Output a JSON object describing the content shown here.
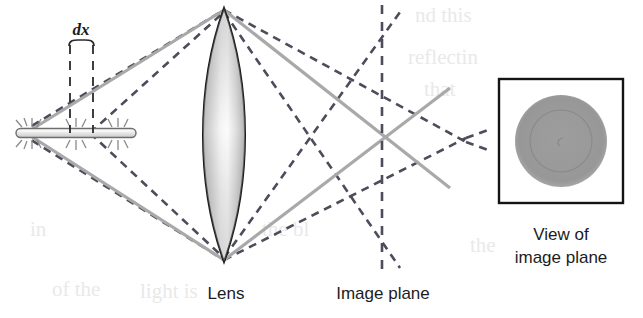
{
  "figure": {
    "width": 643,
    "height": 318,
    "background_color": "#ffffff"
  },
  "labels": {
    "dx": "dx",
    "lens": "Lens",
    "image_plane": "Image plane",
    "view_of_image_plane_line1": "View of",
    "view_of_image_plane_line2": "image plane"
  },
  "colors": {
    "ink": "#1c1c1c",
    "dashed_ray": "#4c4c5a",
    "solid_ray": "#a9a9a9",
    "lens_outline": "#1a1a1a",
    "lens_fill_light": "#fbfbfb",
    "lens_fill_dark": "#8e8e8e",
    "object_fill": "#d8d8d8",
    "object_outline": "#6e6e6e",
    "blur_disk": "#9a9a9a",
    "blur_disk_inner": "#8e8e8e",
    "panel_border": "#141414",
    "ghost_text": "#ededed"
  },
  "geometry": {
    "object": {
      "x_left": 16,
      "x_right": 136,
      "y": 133,
      "thickness": 9,
      "dx_mark_left": 70,
      "dx_mark_right": 93
    },
    "lens": {
      "center_x": 224,
      "top_y": 8,
      "bottom_y": 262,
      "half_width": 24
    },
    "image_plane": {
      "x": 382,
      "y_top": 5,
      "y_bottom": 270
    },
    "focus_point_solid": {
      "x": 382,
      "y": 136
    },
    "focus_point_dashed": {
      "x": 466,
      "y": 140
    },
    "view_panel": {
      "x": 499,
      "y": 79,
      "width": 124,
      "height": 124,
      "disk_cx": 561,
      "disk_cy": 141,
      "disk_r_outer": 46,
      "disk_r_inner": 31
    }
  },
  "rays": {
    "solid_label": "in-focus chief rays (solid gray)",
    "dashed_label": "defocused marginal rays (dashed)"
  },
  "background_ghost_text": [
    {
      "text": "nd this",
      "x": 415,
      "y": 20
    },
    {
      "text": "reflectin",
      "x": 406,
      "y": 62
    },
    {
      "text": "that",
      "x": 420,
      "y": 92
    },
    {
      "text": "in",
      "x": 34,
      "y": 232
    },
    {
      "text": "of the",
      "x": 55,
      "y": 293
    },
    {
      "text": "light is",
      "x": 136,
      "y": 296
    },
    {
      "text": "the bl",
      "x": 266,
      "y": 232
    }
  ]
}
